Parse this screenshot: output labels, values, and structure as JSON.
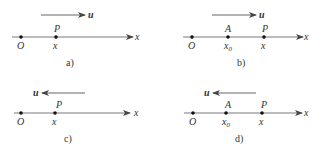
{
  "panels": [
    {
      "id": "a",
      "caption": "a)",
      "velocity_label": "u",
      "velocity_direction": "right",
      "axis_label": "x",
      "points": [
        {
          "name": "O",
          "below": "O",
          "above": ""
        },
        {
          "name": "P",
          "below": "x",
          "above": "P"
        }
      ]
    },
    {
      "id": "b",
      "caption": "b)",
      "velocity_label": "u",
      "velocity_direction": "right",
      "axis_label": "x",
      "points": [
        {
          "name": "O",
          "below": "O",
          "above": ""
        },
        {
          "name": "A",
          "below": "x",
          "below_sub": "0",
          "above": "A"
        },
        {
          "name": "P",
          "below": "x",
          "above": "P"
        }
      ]
    },
    {
      "id": "c",
      "caption": "c)",
      "velocity_label": "u",
      "velocity_direction": "left",
      "axis_label": "x",
      "points": [
        {
          "name": "O",
          "below": "O",
          "above": ""
        },
        {
          "name": "P",
          "below": "x",
          "above": "P"
        }
      ]
    },
    {
      "id": "d",
      "caption": "d)",
      "velocity_label": "u",
      "velocity_direction": "left",
      "axis_label": "x",
      "points": [
        {
          "name": "O",
          "below": "O",
          "above": ""
        },
        {
          "name": "A",
          "below": "x",
          "below_sub": "0",
          "above": "A"
        },
        {
          "name": "P",
          "below": "x",
          "above": "P"
        }
      ]
    }
  ]
}
